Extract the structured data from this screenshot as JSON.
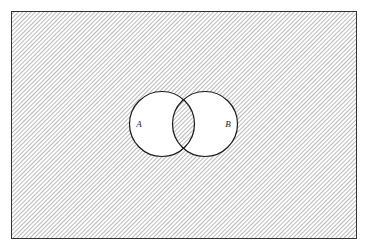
{
  "figure": {
    "name": "venn-diagram-two-sets",
    "width": 368,
    "height": 252,
    "background_color": "#ffffff",
    "caption": ""
  },
  "universe": {
    "label": "",
    "shape": "rectangle",
    "x": 11,
    "y": 11,
    "width": 346,
    "height": 228,
    "border_color": "#333333",
    "border_width": 1,
    "fill": "diagonal-hatch",
    "hatch_color": "#808080",
    "hatch_angle_deg": 45,
    "hatch_spacing_px": 3,
    "shaded": true
  },
  "sets": [
    {
      "id": "A",
      "label": "A",
      "label_x": 139,
      "label_y": 127,
      "cx": 162,
      "cy": 124,
      "r": 32.5,
      "fill_color": "#ffffff",
      "border_color": "#1a1a1a",
      "border_width": 1.2,
      "shaded": false
    },
    {
      "id": "B",
      "label": "B",
      "label_x": 228,
      "label_y": 127,
      "cx": 205,
      "cy": 124,
      "r": 32.5,
      "fill_color": "#ffffff",
      "border_color": "#1a1a1a",
      "border_width": 1.2,
      "shaded": false
    }
  ],
  "regions": {
    "intersection_shaded": false,
    "union_shaded": false,
    "complement_shaded": true,
    "description": "Shaded region is the complement of A union B"
  },
  "colors": {
    "ink": "#1a1a1a",
    "hatch": "#808080",
    "frame": "#333333",
    "paper": "#ffffff"
  }
}
